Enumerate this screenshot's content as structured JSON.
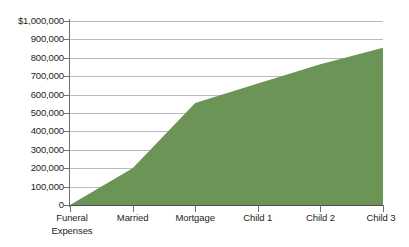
{
  "chart_data": {
    "type": "area",
    "title": "",
    "subtitle": "",
    "xlabel": "",
    "ylabel": "",
    "categories": [
      "Funeral Expenses",
      "Married",
      "Mortgage",
      "Child 1",
      "Child 2",
      "Child 3"
    ],
    "category_lines": [
      [
        "Funeral",
        "Expenses"
      ],
      [
        "Married"
      ],
      [
        "Mortgage"
      ],
      [
        "Child 1"
      ],
      [
        "Child 2"
      ],
      [
        "Child 3"
      ]
    ],
    "values": [
      0,
      200000,
      555000,
      660000,
      765000,
      855000
    ],
    "series": [
      {
        "name": "Cumulative Life Insurance Need",
        "values": [
          0,
          200000,
          555000,
          660000,
          765000,
          855000
        ]
      }
    ],
    "ylim": [
      0,
      1000000
    ],
    "ytick_values": [
      0,
      100000,
      200000,
      300000,
      400000,
      500000,
      600000,
      700000,
      800000,
      900000,
      1000000
    ],
    "ytick_labels": [
      "0",
      "100,000",
      "200,000",
      "300,000",
      "400,000",
      "500,000",
      "600,000",
      "700,000",
      "800,000",
      "900,000",
      "$1,000,000"
    ],
    "grid": true,
    "legend": "none",
    "colors": {
      "area_fill": "#6b9456",
      "gridline": "#b9babc",
      "axis": "#6e6f71",
      "text": "#231f20",
      "background": "#ffffff"
    }
  }
}
